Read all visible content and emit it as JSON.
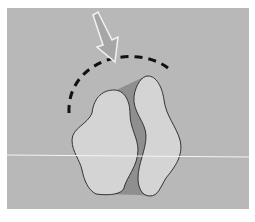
{
  "figure": {
    "type": "illustration",
    "colors": {
      "background": "#b8b8b8",
      "lobe_fill": "#d4d4d4",
      "channel_fill": "#8f8f8f",
      "outline": "#333333",
      "dash": "#111111",
      "arrow_fill": "#a6a6a6",
      "arrow_stroke": "#f2f2f2",
      "horizontal_line": "#f4f4f4"
    },
    "elements": {
      "arrow": "pointing down-right toward dashed arc",
      "dashed_arc": "dashed semicircle arc above shapes",
      "left_lobe": "left rounded lobe",
      "right_lobe": "right rounded lobe",
      "channel": "darker gap between lobes",
      "horizontal_line": "thin white horizontal line"
    }
  }
}
